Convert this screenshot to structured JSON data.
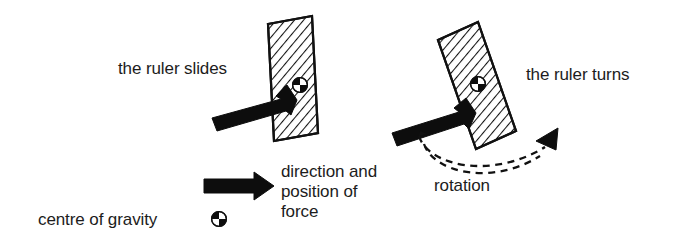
{
  "figure": {
    "background_color": "#ffffff",
    "ink_color": "#111111",
    "width": 696,
    "height": 246
  },
  "labels": {
    "left_caption": "the ruler slides",
    "right_caption": "the ruler turns",
    "force_legend_line1": "direction and",
    "force_legend_line2": "position of",
    "force_legend_line3": "force",
    "cog_legend": "centre of gravity",
    "rotation_label": "rotation"
  },
  "panels": [
    {
      "name": "slides",
      "caption": "the ruler slides",
      "ruler_tilt_degrees": 10,
      "force_applied_at_centre_of_gravity": true,
      "force_arrow_angle_degrees": -28,
      "result": "translation"
    },
    {
      "name": "turns",
      "caption": "the ruler turns",
      "ruler_tilt_degrees": 17,
      "force_applied_at_centre_of_gravity": false,
      "force_arrow_angle_degrees": -25,
      "result": "rotation"
    }
  ],
  "symbols": {
    "centre_of_gravity": "quartered-circle",
    "force": "solid-block-arrow",
    "rotation": "double-dashed-curved-arrow"
  }
}
